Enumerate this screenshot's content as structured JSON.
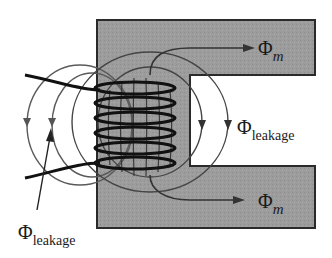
{
  "diagram": {
    "title": "",
    "colors": {
      "core_fill": "#9c9c9c",
      "core_edge": "#2a2a2a",
      "winding": "#111111",
      "flux_line": "#5a5a5a",
      "arrow": "#333333",
      "background": "#ffffff"
    },
    "components": {
      "core": "Magnetic core (C-shaped)",
      "coil": "Winding with 6 turns"
    },
    "labels": {
      "phi_m_top": {
        "symbol": "Φ",
        "subscript": "m"
      },
      "phi_m_bottom": {
        "symbol": "Φ",
        "subscript": "m"
      },
      "phi_leakage_right": {
        "symbol": "Φ",
        "subscript": "leakage"
      },
      "phi_leakage_left": {
        "symbol": "Φ",
        "subscript": "leakage"
      }
    }
  }
}
